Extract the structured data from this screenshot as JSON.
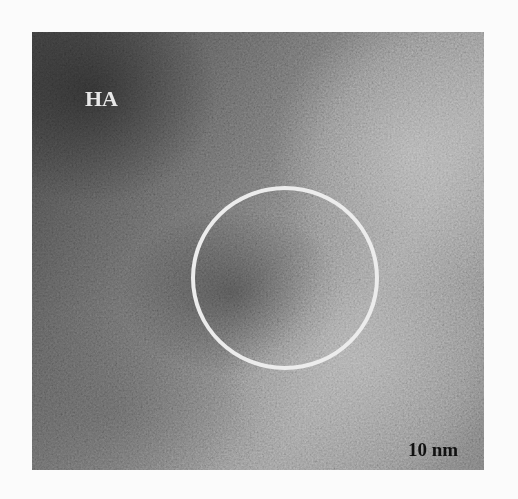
{
  "figure": {
    "panel_label": "HA",
    "scale_bar": {
      "label": "10 nm",
      "length_px": 101
    },
    "annotation": {
      "shape": "circle",
      "color": "#ececec"
    },
    "colors": {
      "background": "#fbfbfb",
      "label": "#e8e8e8",
      "scale": "#111111"
    }
  }
}
